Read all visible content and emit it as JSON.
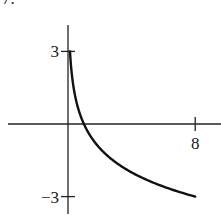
{
  "problem_number": "7.",
  "chart_data": {
    "type": "line",
    "title": "",
    "function": "y = log_{1/2}(x)",
    "xlabel": "",
    "ylabel": "",
    "x_ticks": [
      {
        "value": 8,
        "label": "8"
      }
    ],
    "y_ticks": [
      {
        "value": 3,
        "label": "3"
      },
      {
        "value": -3,
        "label": "−3"
      }
    ],
    "xlim": [
      -3.7,
      9.6
    ],
    "ylim": [
      -3.7,
      4.1
    ],
    "grid": false,
    "legend": null,
    "series": [
      {
        "name": "curve",
        "color": "#111111",
        "x": [
          0.125,
          0.18,
          0.25,
          0.35,
          0.5,
          0.7,
          1,
          1.5,
          2,
          3,
          4,
          5,
          6,
          7,
          8
        ],
        "y": [
          3,
          2.47,
          2,
          1.51,
          1,
          0.51,
          0,
          -0.58,
          -1,
          -1.58,
          -2,
          -2.32,
          -2.58,
          -2.81,
          -3
        ]
      }
    ]
  },
  "layout": {
    "origin_px": [
      68,
      124
    ],
    "px_per_x": 15.9,
    "px_per_y": 24.2
  }
}
